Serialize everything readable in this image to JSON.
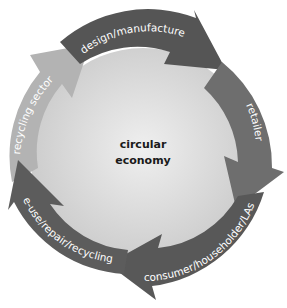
{
  "diagram": {
    "center": {
      "line1": "circular",
      "line2": "economy"
    },
    "segments": [
      {
        "id": "design",
        "label": "design/manufacture",
        "color": "#555555"
      },
      {
        "id": "retailer",
        "label": "retailer",
        "color": "#6e6e6e"
      },
      {
        "id": "consumer",
        "label": "consumer/householder/LAs",
        "color": "#585858"
      },
      {
        "id": "reuse",
        "label": "re-use/repair/recycling",
        "color": "#5c5c5c"
      },
      {
        "id": "recycling",
        "label": "recycling sector",
        "color": "#b3b3b3"
      }
    ],
    "colors": {
      "center_inner": "#ececec",
      "center_outer": "#c9c9c9",
      "background": "#ffffff"
    }
  }
}
